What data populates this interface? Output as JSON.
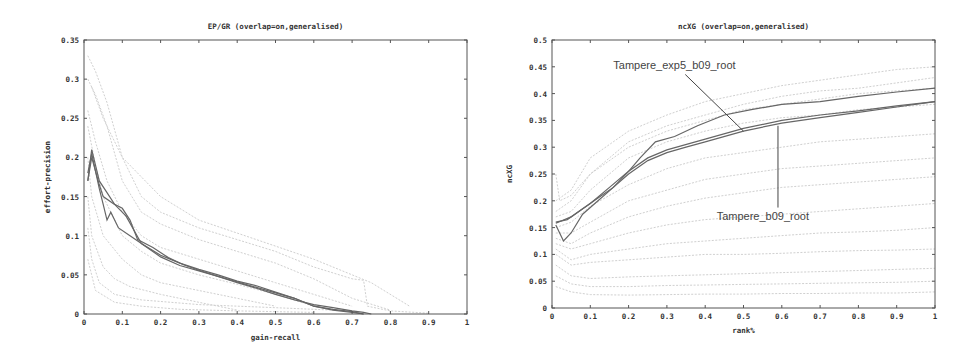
{
  "chart_data": [
    {
      "id": "ep-gr",
      "type": "line",
      "title": "EP/GR (overlap=on,generalised)",
      "xlabel": "gain-recall",
      "ylabel": "effort-precision",
      "xlim": [
        0,
        1
      ],
      "ylim": [
        0,
        0.35
      ],
      "xticks": [
        0,
        0.1,
        0.2,
        0.3,
        0.4,
        0.5,
        0.6,
        0.7,
        0.8,
        0.9,
        1
      ],
      "xtick_labels": [
        "0",
        "0.1",
        "0.2",
        "0.3",
        "0.4",
        "0.5",
        "0.6",
        "0.7",
        "0.8",
        "0.9",
        "1"
      ],
      "yticks": [
        0,
        0.05,
        0.1,
        0.15,
        0.2,
        0.25,
        0.3,
        0.35
      ],
      "ytick_labels": [
        "0",
        "0.05",
        "0.1",
        "0.15",
        "0.2",
        "0.25",
        "0.3",
        "0.35"
      ],
      "grid": false,
      "legend": "none",
      "background_series_color": "#d0d0d0",
      "highlight_color": "#666666",
      "highlight_series": [
        {
          "name": "highlight-1",
          "x": [
            0.01,
            0.02,
            0.04,
            0.06,
            0.08,
            0.1,
            0.12,
            0.14,
            0.18,
            0.22,
            0.26,
            0.3,
            0.35,
            0.4,
            0.45,
            0.5,
            0.55,
            0.6,
            0.65,
            0.7,
            0.73,
            0.75
          ],
          "y": [
            0.17,
            0.21,
            0.17,
            0.155,
            0.14,
            0.135,
            0.12,
            0.095,
            0.085,
            0.072,
            0.063,
            0.056,
            0.048,
            0.04,
            0.033,
            0.025,
            0.018,
            0.012,
            0.008,
            0.004,
            0.002,
            0.0
          ]
        },
        {
          "name": "highlight-2",
          "x": [
            0.01,
            0.02,
            0.04,
            0.05,
            0.06,
            0.07,
            0.09,
            0.12,
            0.15,
            0.2,
            0.25,
            0.3,
            0.35,
            0.4,
            0.45,
            0.5,
            0.55,
            0.6,
            0.65,
            0.7,
            0.73
          ],
          "y": [
            0.18,
            0.205,
            0.16,
            0.14,
            0.12,
            0.13,
            0.11,
            0.1,
            0.09,
            0.075,
            0.065,
            0.057,
            0.05,
            0.042,
            0.036,
            0.028,
            0.02,
            0.01,
            0.006,
            0.003,
            0.0
          ]
        },
        {
          "name": "highlight-3",
          "x": [
            0.01,
            0.02,
            0.04,
            0.05,
            0.08,
            0.11,
            0.15,
            0.2,
            0.25,
            0.3,
            0.35,
            0.4,
            0.45,
            0.5,
            0.55,
            0.6,
            0.65,
            0.7,
            0.73
          ],
          "y": [
            0.17,
            0.2,
            0.165,
            0.15,
            0.14,
            0.125,
            0.09,
            0.073,
            0.062,
            0.055,
            0.048,
            0.041,
            0.034,
            0.027,
            0.02,
            0.01,
            0.005,
            0.002,
            0.0
          ]
        }
      ],
      "background_series": [
        {
          "x": [
            0.01,
            0.03,
            0.06,
            0.1,
            0.15,
            0.2,
            0.3,
            0.4,
            0.5,
            0.6,
            0.7,
            0.73,
            0.74,
            0.8,
            0.9
          ],
          "y": [
            0.33,
            0.31,
            0.27,
            0.2,
            0.15,
            0.13,
            0.11,
            0.095,
            0.08,
            0.06,
            0.045,
            0.043,
            0.01,
            0.004,
            0.001
          ]
        },
        {
          "x": [
            0.01,
            0.03,
            0.06,
            0.1,
            0.15,
            0.2,
            0.3,
            0.4,
            0.5,
            0.6,
            0.7,
            0.8
          ],
          "y": [
            0.3,
            0.28,
            0.24,
            0.17,
            0.13,
            0.115,
            0.095,
            0.08,
            0.065,
            0.045,
            0.02,
            0.005
          ]
        },
        {
          "x": [
            0.01,
            0.03,
            0.06,
            0.1,
            0.15,
            0.2,
            0.3,
            0.4,
            0.5,
            0.6,
            0.7
          ],
          "y": [
            0.26,
            0.22,
            0.17,
            0.13,
            0.1,
            0.085,
            0.07,
            0.055,
            0.04,
            0.025,
            0.01
          ]
        },
        {
          "x": [
            0.01,
            0.03,
            0.05,
            0.1,
            0.15,
            0.2,
            0.3,
            0.4,
            0.5,
            0.6
          ],
          "y": [
            0.24,
            0.19,
            0.15,
            0.1,
            0.08,
            0.065,
            0.05,
            0.038,
            0.025,
            0.01
          ]
        },
        {
          "x": [
            0.01,
            0.02,
            0.05,
            0.1,
            0.15,
            0.2,
            0.3,
            0.4,
            0.5
          ],
          "y": [
            0.2,
            0.15,
            0.1,
            0.07,
            0.05,
            0.04,
            0.03,
            0.02,
            0.01
          ]
        },
        {
          "x": [
            0.01,
            0.02,
            0.05,
            0.08,
            0.12,
            0.2,
            0.3,
            0.4
          ],
          "y": [
            0.15,
            0.1,
            0.06,
            0.045,
            0.035,
            0.025,
            0.015,
            0.005
          ]
        },
        {
          "x": [
            0.01,
            0.02,
            0.04,
            0.08,
            0.15,
            0.3,
            0.5,
            0.7
          ],
          "y": [
            0.11,
            0.07,
            0.04,
            0.025,
            0.018,
            0.012,
            0.008,
            0.004
          ]
        },
        {
          "x": [
            0.01,
            0.03,
            0.08,
            0.15,
            0.25,
            0.4,
            0.6
          ],
          "y": [
            0.07,
            0.03,
            0.015,
            0.01,
            0.006,
            0.004,
            0.002
          ]
        },
        {
          "x": [
            0.02,
            0.05,
            0.1,
            0.2,
            0.3,
            0.45,
            0.6,
            0.75,
            0.85
          ],
          "y": [
            0.29,
            0.25,
            0.2,
            0.15,
            0.12,
            0.095,
            0.07,
            0.04,
            0.01
          ]
        }
      ]
    },
    {
      "id": "ncxg",
      "type": "line",
      "title": "ncXG (overlap=on,generalised)",
      "xlabel": "rank%",
      "ylabel": "ncXG",
      "xlim": [
        0,
        1
      ],
      "ylim": [
        0,
        0.5
      ],
      "xticks": [
        0,
        0.1,
        0.2,
        0.3,
        0.4,
        0.5,
        0.6,
        0.7,
        0.8,
        0.9,
        1
      ],
      "xtick_labels": [
        "0",
        "0.1",
        "0.2",
        "0.3",
        "0.4",
        "0.5",
        "0.6",
        "0.7",
        "0.8",
        "0.9",
        "1"
      ],
      "yticks": [
        0,
        0.05,
        0.1,
        0.15,
        0.2,
        0.25,
        0.3,
        0.35,
        0.4,
        0.45,
        0.5
      ],
      "ytick_labels": [
        "0",
        "0.05",
        "0.1",
        "0.15",
        "0.2",
        "0.25",
        "0.3",
        "0.35",
        "0.4",
        "0.45",
        "0.5"
      ],
      "grid": false,
      "legend": "none",
      "background_series_color": "#d0d0d0",
      "highlight_color": "#666666",
      "annotations": [
        {
          "text": "Tampere_exp5_b09_root",
          "label_at": [
            0.16,
            0.445
          ],
          "points_to": [
            0.5,
            0.33
          ]
        },
        {
          "text": "Tampere_b09_root",
          "label_at": [
            0.43,
            0.165
          ],
          "points_to": [
            0.59,
            0.34
          ]
        }
      ],
      "highlight_series": [
        {
          "name": "Tampere_exp5_b09_root",
          "x": [
            0.01,
            0.03,
            0.05,
            0.08,
            0.12,
            0.16,
            0.2,
            0.23,
            0.27,
            0.32,
            0.38,
            0.45,
            0.52,
            0.6,
            0.7,
            0.8,
            0.9,
            1.0
          ],
          "y": [
            0.155,
            0.125,
            0.14,
            0.175,
            0.2,
            0.225,
            0.255,
            0.28,
            0.31,
            0.32,
            0.34,
            0.36,
            0.37,
            0.38,
            0.385,
            0.395,
            0.403,
            0.41
          ]
        },
        {
          "name": "Tampere_b09_root",
          "x": [
            0.01,
            0.04,
            0.08,
            0.12,
            0.16,
            0.2,
            0.25,
            0.3,
            0.35,
            0.4,
            0.5,
            0.6,
            0.7,
            0.8,
            0.9,
            1.0
          ],
          "y": [
            0.16,
            0.165,
            0.185,
            0.205,
            0.225,
            0.25,
            0.275,
            0.29,
            0.3,
            0.31,
            0.33,
            0.345,
            0.355,
            0.365,
            0.375,
            0.385
          ]
        },
        {
          "name": "highlight-3",
          "x": [
            0.01,
            0.05,
            0.1,
            0.15,
            0.2,
            0.25,
            0.3,
            0.4,
            0.5,
            0.6,
            0.7,
            0.8,
            0.9,
            1.0
          ],
          "y": [
            0.158,
            0.17,
            0.195,
            0.225,
            0.255,
            0.28,
            0.295,
            0.315,
            0.335,
            0.35,
            0.36,
            0.368,
            0.377,
            0.385
          ]
        }
      ],
      "background_series": [
        {
          "x": [
            0.01,
            0.05,
            0.1,
            0.2,
            0.3,
            0.4,
            0.5,
            0.6,
            0.7,
            0.8,
            0.9,
            1.0
          ],
          "y": [
            0.2,
            0.22,
            0.28,
            0.33,
            0.36,
            0.385,
            0.4,
            0.415,
            0.425,
            0.435,
            0.445,
            0.45
          ]
        },
        {
          "x": [
            0.01,
            0.05,
            0.1,
            0.2,
            0.3,
            0.4,
            0.5,
            0.6,
            0.7,
            0.8,
            0.9,
            1.0
          ],
          "y": [
            0.18,
            0.2,
            0.25,
            0.31,
            0.34,
            0.36,
            0.38,
            0.395,
            0.405,
            0.41,
            0.42,
            0.43
          ]
        },
        {
          "x": [
            0.01,
            0.05,
            0.1,
            0.2,
            0.3,
            0.4,
            0.5,
            0.6,
            0.7,
            0.8,
            0.9,
            1.0
          ],
          "y": [
            0.17,
            0.18,
            0.22,
            0.28,
            0.31,
            0.33,
            0.345,
            0.355,
            0.36,
            0.37,
            0.375,
            0.38
          ]
        },
        {
          "x": [
            0.01,
            0.05,
            0.1,
            0.2,
            0.3,
            0.4,
            0.5,
            0.6,
            0.7,
            0.8,
            0.9,
            1.0
          ],
          "y": [
            0.15,
            0.16,
            0.19,
            0.23,
            0.26,
            0.28,
            0.29,
            0.3,
            0.31,
            0.315,
            0.32,
            0.325
          ]
        },
        {
          "x": [
            0.01,
            0.05,
            0.1,
            0.2,
            0.3,
            0.4,
            0.5,
            0.6,
            0.7,
            0.8,
            0.9,
            1.0
          ],
          "y": [
            0.14,
            0.14,
            0.16,
            0.2,
            0.22,
            0.24,
            0.25,
            0.26,
            0.265,
            0.27,
            0.275,
            0.28
          ]
        },
        {
          "x": [
            0.01,
            0.05,
            0.1,
            0.2,
            0.3,
            0.4,
            0.5,
            0.6,
            0.7,
            0.8,
            0.9,
            1.0
          ],
          "y": [
            0.13,
            0.12,
            0.14,
            0.17,
            0.19,
            0.205,
            0.215,
            0.225,
            0.23,
            0.235,
            0.24,
            0.245
          ]
        },
        {
          "x": [
            0.01,
            0.05,
            0.1,
            0.2,
            0.3,
            0.4,
            0.5,
            0.6,
            0.7,
            0.8,
            0.9,
            1.0
          ],
          "y": [
            0.12,
            0.11,
            0.12,
            0.14,
            0.155,
            0.165,
            0.17,
            0.175,
            0.18,
            0.185,
            0.19,
            0.195
          ]
        },
        {
          "x": [
            0.01,
            0.05,
            0.1,
            0.2,
            0.3,
            0.4,
            0.5,
            0.6,
            0.7,
            0.8,
            0.9,
            1.0
          ],
          "y": [
            0.11,
            0.09,
            0.1,
            0.11,
            0.12,
            0.125,
            0.13,
            0.135,
            0.14,
            0.142,
            0.145,
            0.15
          ]
        },
        {
          "x": [
            0.01,
            0.05,
            0.1,
            0.2,
            0.3,
            0.4,
            0.5,
            0.6,
            0.7,
            0.8,
            0.9,
            1.0
          ],
          "y": [
            0.1,
            0.08,
            0.085,
            0.09,
            0.095,
            0.1,
            0.1,
            0.102,
            0.105,
            0.107,
            0.108,
            0.11
          ]
        },
        {
          "x": [
            0.01,
            0.05,
            0.1,
            0.2,
            0.3,
            0.4,
            0.5,
            0.6,
            0.7,
            0.8,
            0.9,
            1.0
          ],
          "y": [
            0.08,
            0.06,
            0.055,
            0.058,
            0.06,
            0.062,
            0.064,
            0.066,
            0.068,
            0.07,
            0.072,
            0.074
          ]
        },
        {
          "x": [
            0.01,
            0.05,
            0.1,
            0.2,
            0.3,
            0.4,
            0.5,
            0.6,
            0.7,
            0.8,
            0.9,
            1.0
          ],
          "y": [
            0.06,
            0.045,
            0.04,
            0.04,
            0.042,
            0.043,
            0.044,
            0.045,
            0.046,
            0.047,
            0.048,
            0.05
          ]
        },
        {
          "x": [
            0.01,
            0.05,
            0.1,
            0.2,
            0.3,
            0.4,
            0.5,
            0.6,
            0.7,
            0.8,
            0.9,
            1.0
          ],
          "y": [
            0.04,
            0.03,
            0.025,
            0.024,
            0.025,
            0.026,
            0.026,
            0.027,
            0.027,
            0.028,
            0.028,
            0.03
          ]
        },
        {
          "x": [
            0.01,
            0.02,
            0.05,
            0.1,
            0.2,
            0.3,
            0.4,
            0.5,
            0.6,
            0.7,
            0.8,
            0.9,
            1.0
          ],
          "y": [
            0.25,
            0.2,
            0.21,
            0.25,
            0.3,
            0.33,
            0.35,
            0.37,
            0.38,
            0.39,
            0.4,
            0.405,
            0.41
          ]
        }
      ]
    }
  ]
}
